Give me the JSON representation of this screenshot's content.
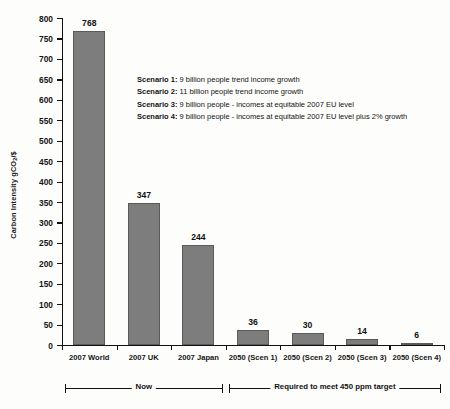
{
  "chart_data": {
    "type": "bar",
    "title": "",
    "xlabel": "",
    "ylabel": "Carbon Intensity gCO2/$",
    "ylabel_parts": {
      "pre": "Carbon Intensity gCO",
      "sub": "2",
      "post": "/$"
    },
    "ylim": [
      0,
      800
    ],
    "ytick_step": 50,
    "yticks": [
      0,
      50,
      100,
      150,
      200,
      250,
      300,
      350,
      400,
      450,
      500,
      550,
      600,
      650,
      700,
      750,
      800
    ],
    "grid": false,
    "legend_position": "inside-upper-center",
    "categories": [
      "2007 World",
      "2007 UK",
      "2007 Japan",
      "2050 (Scen 1)",
      "2050 (Scen 2)",
      "2050 (Scen 3)",
      "2050 (Scen 4)"
    ],
    "values": [
      768,
      347,
      244,
      36,
      30,
      14,
      6
    ],
    "bar_color": "#7d7d7d",
    "bar_edge_color": "#5a5a5a",
    "annotations": [
      {
        "label": "Now",
        "span": [
          0,
          2
        ]
      },
      {
        "label": "Required to meet 450 ppm target",
        "span": [
          3,
          6
        ]
      }
    ]
  },
  "legend": {
    "rows": [
      {
        "label": "Scenario 1:",
        "text": "9 billion people trend income growth"
      },
      {
        "label": "Scenario 2:",
        "text": "11 billion people trend income growth"
      },
      {
        "label": "Scenario 3:",
        "text": "9 billion people - incomes at equitable 2007 EU level"
      },
      {
        "label": "Scenario 4:",
        "text": "9 billion people - incomes at equitable 2007 EU level plus 2% growth"
      }
    ]
  },
  "brackets": {
    "now": "Now",
    "target": "Required to meet 450 ppm target"
  }
}
